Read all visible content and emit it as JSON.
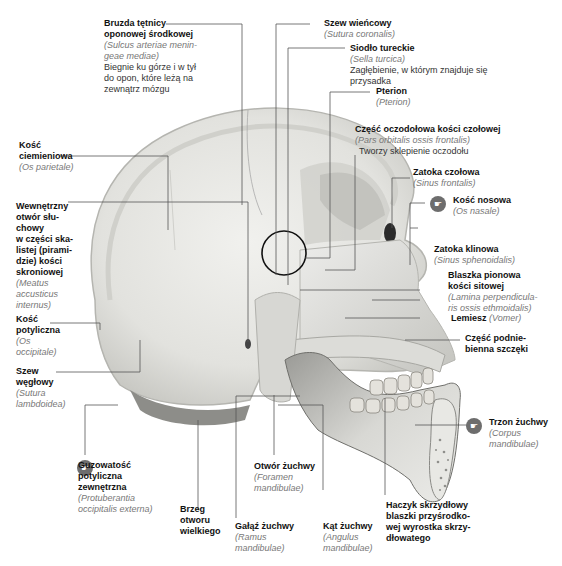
{
  "diagram": {
    "colors": {
      "line": "#555555",
      "bone_light": "#e9e9e6",
      "bone_mid": "#cfcfcb",
      "bone_dark": "#8f8f8b",
      "shadow": "#2b2b2b",
      "icon": "#6d6d6d",
      "latin": "#777777"
    },
    "icons": {
      "hand": "pointing-hand-icon",
      "glyph": "☛"
    },
    "labels": {
      "bruzda": {
        "title": "Bruzda tętnicy\noponowej środkowej",
        "latin": "(Sulcus arteriae menin-\ngeae mediae)",
        "desc": "Biegnie ku górze i w tył\ndo opon, które leżą na\nzewnątrz mózgu"
      },
      "szew_wiencowy": {
        "title": "Szew wieńcowy",
        "latin": "(Sutura coronalis)"
      },
      "siodlo": {
        "title": "Siodło tureckie",
        "latin": "(Sella turcica)",
        "desc": "Zagłębienie, w którym znajduje się\nprzysadka"
      },
      "pterion": {
        "title": "Pterion",
        "latin": "(Pterion)"
      },
      "czesc_oczodolowa": {
        "title": "Część oczodołowa kości czołowej",
        "latin": "(Pars orbitalis ossis frontalis)",
        "desc": "Tworzy sklepienie oczodołu"
      },
      "zatoka_czolowa": {
        "title": "Zatoka czołowa",
        "latin": "(Sinus frontalis)"
      },
      "kosc_nosowa": {
        "title": "Kość nosowa",
        "latin": "(Os nasale)"
      },
      "zatoka_klinowa": {
        "title": "Zatoka klinowa",
        "latin": "(Sinus sphenoidalis)"
      },
      "blaszka": {
        "title": "Blaszka pionowa\nkości sitowej",
        "latin": "(Lamina perpendicula-\nris ossis ethmoidalis)"
      },
      "lemiesz": {
        "title": "Lemiesz",
        "latin": "(Vomer)"
      },
      "czesc_podniebienna": {
        "title": "Część podnie-\nbienna szczęki"
      },
      "trzon": {
        "title": "Trzon żuchwy",
        "latin": "(Corpus\nmandibulae)"
      },
      "haczyk": {
        "title": "Haczyk skrzydłowy\nblaszki przyśrodko-\nwej wyrostka skrzy-\ndłowatego"
      },
      "kat": {
        "title": "Kąt żuchwy",
        "latin": "(Angulus\nmandibulae)"
      },
      "otwor_zuchwy": {
        "title": "Otwór żuchwy",
        "latin": "(Foramen\nmandibulae)"
      },
      "galaz": {
        "title": "Gałąź żuchwy",
        "latin": "(Ramus\nmandibulae)"
      },
      "brzeg": {
        "title": "Brzeg\notworu\nwielkiego"
      },
      "guzowatosc": {
        "title": "Guzowatość\npotyliczna\nzewnętrzna",
        "latin": "(Protuberantia\noccipitalis externa)"
      },
      "szew_weglowy": {
        "title": "Szew\nwęgłowy",
        "latin": "(Sutura\nlambdoidea)"
      },
      "kosc_potyliczna": {
        "title": "Kość\npotyliczna",
        "latin": "(Os\noccipitale)"
      },
      "wewnetrzny": {
        "title": "Wewnętrzny\notwór słu-\nchowy\nw części ska-\nlistej (pirami-\ndzie) kości\nskroniowej",
        "latin": "(Meatus\naccusticus\ninternus)"
      },
      "kosc_ciemieniowa": {
        "title": "Kość\nciemieniowa",
        "latin": "(Os parietale)"
      }
    }
  }
}
